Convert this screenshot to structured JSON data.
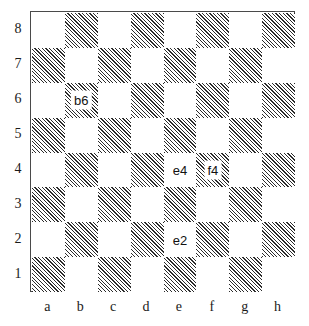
{
  "diagram": {
    "type": "chessboard",
    "title": "",
    "board": {
      "files": [
        "a",
        "b",
        "c",
        "d",
        "e",
        "f",
        "g",
        "h"
      ],
      "ranks": [
        "8",
        "7",
        "6",
        "5",
        "4",
        "3",
        "2",
        "1"
      ],
      "light_square_color": "#ffffff",
      "dark_square_fill": "diagonal-hatch",
      "dark_square_line_color": "#2b2b2b",
      "border_color": "#4a4a4a",
      "a8_shade": "light",
      "rows": [
        [
          {
            "square": "a8",
            "shade": "light",
            "label": ""
          },
          {
            "square": "b8",
            "shade": "dark",
            "label": ""
          },
          {
            "square": "c8",
            "shade": "light",
            "label": ""
          },
          {
            "square": "d8",
            "shade": "dark",
            "label": ""
          },
          {
            "square": "e8",
            "shade": "light",
            "label": ""
          },
          {
            "square": "f8",
            "shade": "dark",
            "label": ""
          },
          {
            "square": "g8",
            "shade": "light",
            "label": ""
          },
          {
            "square": "h8",
            "shade": "dark",
            "label": ""
          }
        ],
        [
          {
            "square": "a7",
            "shade": "dark",
            "label": ""
          },
          {
            "square": "b7",
            "shade": "light",
            "label": ""
          },
          {
            "square": "c7",
            "shade": "dark",
            "label": ""
          },
          {
            "square": "d7",
            "shade": "light",
            "label": ""
          },
          {
            "square": "e7",
            "shade": "dark",
            "label": ""
          },
          {
            "square": "f7",
            "shade": "light",
            "label": ""
          },
          {
            "square": "g7",
            "shade": "dark",
            "label": ""
          },
          {
            "square": "h7",
            "shade": "light",
            "label": ""
          }
        ],
        [
          {
            "square": "a6",
            "shade": "light",
            "label": ""
          },
          {
            "square": "b6",
            "shade": "dark",
            "label": "b6"
          },
          {
            "square": "c6",
            "shade": "light",
            "label": ""
          },
          {
            "square": "d6",
            "shade": "dark",
            "label": ""
          },
          {
            "square": "e6",
            "shade": "light",
            "label": ""
          },
          {
            "square": "f6",
            "shade": "dark",
            "label": ""
          },
          {
            "square": "g6",
            "shade": "light",
            "label": ""
          },
          {
            "square": "h6",
            "shade": "dark",
            "label": ""
          }
        ],
        [
          {
            "square": "a5",
            "shade": "dark",
            "label": ""
          },
          {
            "square": "b5",
            "shade": "light",
            "label": ""
          },
          {
            "square": "c5",
            "shade": "dark",
            "label": ""
          },
          {
            "square": "d5",
            "shade": "light",
            "label": ""
          },
          {
            "square": "e5",
            "shade": "dark",
            "label": ""
          },
          {
            "square": "f5",
            "shade": "light",
            "label": ""
          },
          {
            "square": "g5",
            "shade": "dark",
            "label": ""
          },
          {
            "square": "h5",
            "shade": "light",
            "label": ""
          }
        ],
        [
          {
            "square": "a4",
            "shade": "light",
            "label": ""
          },
          {
            "square": "b4",
            "shade": "dark",
            "label": ""
          },
          {
            "square": "c4",
            "shade": "light",
            "label": ""
          },
          {
            "square": "d4",
            "shade": "dark",
            "label": ""
          },
          {
            "square": "e4",
            "shade": "light",
            "label": "e4"
          },
          {
            "square": "f4",
            "shade": "dark",
            "label": "f4"
          },
          {
            "square": "g4",
            "shade": "light",
            "label": ""
          },
          {
            "square": "h4",
            "shade": "dark",
            "label": ""
          }
        ],
        [
          {
            "square": "a3",
            "shade": "dark",
            "label": ""
          },
          {
            "square": "b3",
            "shade": "light",
            "label": ""
          },
          {
            "square": "c3",
            "shade": "dark",
            "label": ""
          },
          {
            "square": "d3",
            "shade": "light",
            "label": ""
          },
          {
            "square": "e3",
            "shade": "dark",
            "label": ""
          },
          {
            "square": "f3",
            "shade": "light",
            "label": ""
          },
          {
            "square": "g3",
            "shade": "dark",
            "label": ""
          },
          {
            "square": "h3",
            "shade": "light",
            "label": ""
          }
        ],
        [
          {
            "square": "a2",
            "shade": "light",
            "label": ""
          },
          {
            "square": "b2",
            "shade": "dark",
            "label": ""
          },
          {
            "square": "c2",
            "shade": "light",
            "label": ""
          },
          {
            "square": "d2",
            "shade": "dark",
            "label": ""
          },
          {
            "square": "e2",
            "shade": "light",
            "label": "e2"
          },
          {
            "square": "f2",
            "shade": "dark",
            "label": ""
          },
          {
            "square": "g2",
            "shade": "light",
            "label": ""
          },
          {
            "square": "h2",
            "shade": "dark",
            "label": ""
          }
        ],
        [
          {
            "square": "a1",
            "shade": "dark",
            "label": ""
          },
          {
            "square": "b1",
            "shade": "light",
            "label": ""
          },
          {
            "square": "c1",
            "shade": "dark",
            "label": ""
          },
          {
            "square": "d1",
            "shade": "light",
            "label": ""
          },
          {
            "square": "e1",
            "shade": "dark",
            "label": ""
          },
          {
            "square": "f1",
            "shade": "light",
            "label": ""
          },
          {
            "square": "g1",
            "shade": "dark",
            "label": ""
          },
          {
            "square": "h1",
            "shade": "light",
            "label": ""
          }
        ]
      ],
      "annotated_squares": [
        "b6",
        "e4",
        "f4",
        "e2"
      ]
    }
  }
}
